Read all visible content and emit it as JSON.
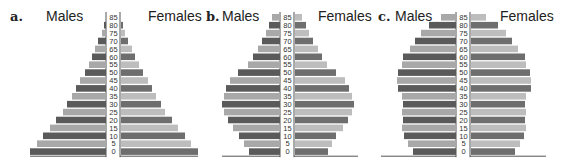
{
  "chart_data": [
    {
      "type": "bar",
      "orientation": "horizontal-population-pyramid",
      "panel": "a.",
      "title": "",
      "left_label": "Males",
      "right_label": "Females",
      "age_groups": [
        "0",
        "5",
        "10",
        "15",
        "20",
        "25",
        "30",
        "35",
        "40",
        "45",
        "50",
        "55",
        "60",
        "65",
        "70",
        "75",
        "80",
        "85"
      ],
      "series": [
        {
          "name": "Males",
          "values": [
            76,
            69,
            63,
            56,
            50,
            43,
            39,
            34,
            30,
            26,
            21,
            17,
            14,
            11,
            8,
            4,
            2,
            0
          ]
        },
        {
          "name": "Females",
          "values": [
            77,
            70,
            64,
            57,
            51,
            44,
            40,
            35,
            31,
            27,
            22,
            18,
            14,
            11,
            7,
            4,
            2,
            0
          ]
        }
      ],
      "xlim": [
        0,
        80
      ],
      "grid": false
    },
    {
      "type": "bar",
      "orientation": "horizontal-population-pyramid",
      "panel": "b.",
      "title": "",
      "left_label": "Males",
      "right_label": "Females",
      "age_groups": [
        "0",
        "5",
        "10",
        "15",
        "20",
        "25",
        "30",
        "35",
        "40",
        "45",
        "50",
        "55",
        "60",
        "65",
        "70",
        "75",
        "80",
        "85"
      ],
      "series": [
        {
          "name": "Males",
          "values": [
            31,
            36,
            41,
            47,
            52,
            56,
            58,
            56,
            54,
            50,
            42,
            32,
            27,
            22,
            18,
            14,
            11,
            8
          ]
        },
        {
          "name": "Females",
          "values": [
            33,
            37,
            41,
            48,
            53,
            57,
            59,
            57,
            54,
            50,
            41,
            32,
            27,
            23,
            18,
            14,
            11,
            7
          ]
        }
      ],
      "xlim": [
        0,
        80
      ],
      "grid": false
    },
    {
      "type": "bar",
      "orientation": "horizontal-population-pyramid",
      "panel": "c.",
      "title": "",
      "left_label": "Males",
      "right_label": "Females",
      "age_groups": [
        "0",
        "5",
        "10",
        "15",
        "20",
        "25",
        "30",
        "35",
        "40",
        "45",
        "50",
        "55",
        "60",
        "65",
        "70",
        "75",
        "80",
        "85"
      ],
      "series": [
        {
          "name": "Males",
          "values": [
            43,
            48,
            52,
            54,
            53,
            54,
            53,
            54,
            58,
            59,
            58,
            54,
            53,
            46,
            41,
            35,
            27,
            15
          ]
        },
        {
          "name": "Females",
          "values": [
            44,
            49,
            53,
            55,
            54,
            55,
            54,
            55,
            60,
            60,
            59,
            55,
            54,
            47,
            41,
            35,
            27,
            15
          ]
        }
      ],
      "xlim": [
        0,
        80
      ],
      "grid": false
    }
  ],
  "colors": {
    "dark_bar": "#5a5a5a",
    "light_bar": "#a8a8a8",
    "dark_bar_female": "#6e6e6e",
    "light_bar_female": "#bdbdbd",
    "axis": "#555555",
    "text": "#222222"
  }
}
